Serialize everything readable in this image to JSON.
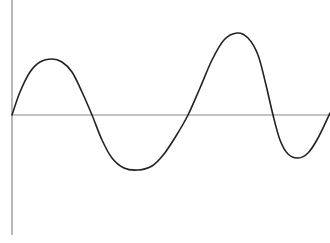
{
  "chart_data": {
    "type": "line",
    "title": "",
    "xlabel": "",
    "ylabel": "",
    "grid": false,
    "legend": null,
    "axes": {
      "y_axis_x": 12,
      "x_axis_y": 115,
      "y_axis_top": 0,
      "y_axis_bottom": 235,
      "color": "#888888"
    },
    "series": [
      {
        "name": "wave",
        "color": "#222222",
        "points_px": [
          [
            12,
            115
          ],
          [
            20,
            92
          ],
          [
            30,
            72
          ],
          [
            40,
            62
          ],
          [
            52,
            59
          ],
          [
            62,
            62
          ],
          [
            72,
            72
          ],
          [
            82,
            92
          ],
          [
            92,
            115
          ],
          [
            102,
            140
          ],
          [
            112,
            158
          ],
          [
            124,
            168
          ],
          [
            138,
            170
          ],
          [
            152,
            166
          ],
          [
            164,
            154
          ],
          [
            176,
            136
          ],
          [
            188,
            115
          ],
          [
            200,
            88
          ],
          [
            212,
            60
          ],
          [
            224,
            40
          ],
          [
            237,
            33
          ],
          [
            248,
            38
          ],
          [
            258,
            55
          ],
          [
            266,
            85
          ],
          [
            273,
            115
          ],
          [
            280,
            140
          ],
          [
            288,
            154
          ],
          [
            298,
            158
          ],
          [
            308,
            153
          ],
          [
            318,
            138
          ],
          [
            330,
            113
          ]
        ]
      }
    ]
  }
}
